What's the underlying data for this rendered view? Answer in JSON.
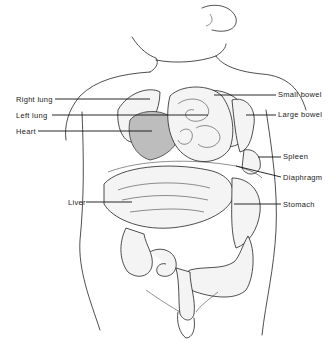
{
  "diagram": {
    "labels_left": [
      {
        "id": "right-lung",
        "text": "Right lung",
        "x": 16,
        "y": 96
      },
      {
        "id": "left-lung",
        "text": "Left lung",
        "x": 16,
        "y": 112
      },
      {
        "id": "heart",
        "text": "Heart",
        "x": 16,
        "y": 128
      },
      {
        "id": "liver",
        "text": "Liver",
        "x": 68,
        "y": 199
      }
    ],
    "labels_right": [
      {
        "id": "small-bowel",
        "text": "Small bowel",
        "x": 278,
        "y": 91
      },
      {
        "id": "large-bowel",
        "text": "Large bowel",
        "x": 278,
        "y": 111
      },
      {
        "id": "spleen",
        "text": "Spleen",
        "x": 283,
        "y": 153
      },
      {
        "id": "diaphragm",
        "text": "Diaphragm",
        "x": 283,
        "y": 174
      },
      {
        "id": "stomach",
        "text": "Stomach",
        "x": 283,
        "y": 201
      }
    ],
    "colors": {
      "line": "#222222",
      "background": "#ffffff"
    }
  }
}
